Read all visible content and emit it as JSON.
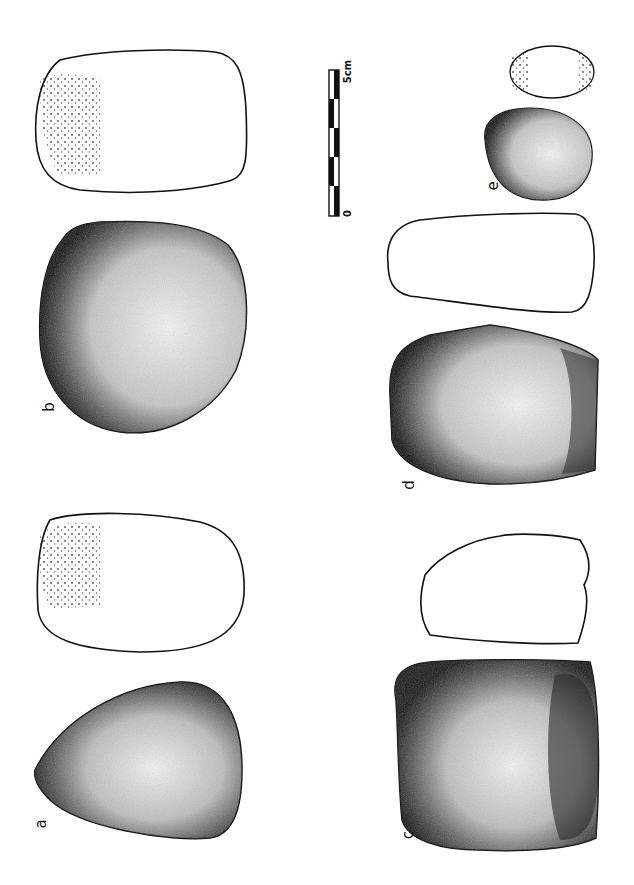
{
  "figure": {
    "ink_color": "#111111",
    "background": "#ffffff"
  },
  "labels": {
    "a": "a",
    "b": "b",
    "c": "c",
    "d": "d",
    "e": "e"
  },
  "scale_bar": {
    "start_label": "0",
    "end_label": "5cm",
    "segments": 5
  }
}
